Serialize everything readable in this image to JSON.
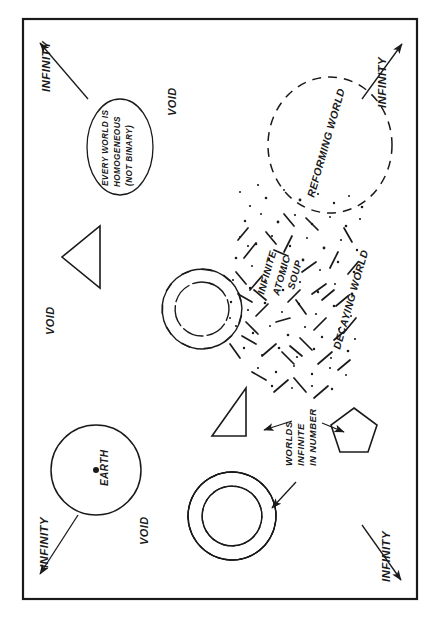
{
  "diagram": {
    "orientation": "labels rotated 90 degrees counter-clockwise",
    "background_color": "#ffffff",
    "ink_color": "#1a1a1a",
    "frame": {
      "x": 22,
      "y": 18,
      "width": 396,
      "height": 582,
      "stroke_width": 2
    }
  },
  "labels": {
    "infinity_top_left": "INFINITY",
    "infinity_top_right": "INFINITY",
    "infinity_bottom_left": "INFINITY",
    "infinity_bottom_right": "INFINITY",
    "void_upper": "VOID",
    "void_middle": "VOID",
    "void_lower": "VOID",
    "earth": "EARTH",
    "reforming_world": "REFORMING WORLD",
    "decaying_world": "DECAYING WORLD",
    "atomic_soup_line1": "INFINITE",
    "atomic_soup_line2": "ATOMIC",
    "atomic_soup_line3": "SOUP",
    "worlds_line1": "WORLDS",
    "worlds_line2": "INFINITE",
    "worlds_line3": "IN NUMBER",
    "homogeneous_line1": "EVERY WORLD IS",
    "homogeneous_line2": "HOMOGENEOUS",
    "homogeneous_line3": "(NOT BINARY)"
  },
  "shapes": {
    "ellipse_callout": {
      "cx": 120,
      "cy": 147,
      "rx": 33,
      "ry": 48
    },
    "earth_circle": {
      "cx": 96,
      "cy": 470,
      "r": 45,
      "dot_r": 3
    },
    "reforming_circle": {
      "cx": 330,
      "cy": 145,
      "rx": 62,
      "ry": 68,
      "dashed": true
    },
    "triangle_upper": {
      "points": "100,226 100,286 64,256"
    },
    "triangle_lower": {
      "points": "244,390 244,434 214,434"
    },
    "pentagon": {
      "cx": 354,
      "cy": 434,
      "r": 26
    },
    "galaxy_upper": {
      "cx": 202,
      "cy": 309,
      "arms": 11
    },
    "galaxy_lower": {
      "cx": 232,
      "cy": 516,
      "arms": 26
    }
  },
  "arrows": {
    "infinity_top_left": {
      "from": [
        86,
        96
      ],
      "to": [
        34,
        36
      ]
    },
    "infinity_top_right": {
      "from": [
        364,
        96
      ],
      "to": [
        406,
        38
      ]
    },
    "infinity_bottom_left": {
      "from": [
        76,
        518
      ],
      "to": [
        34,
        580
      ]
    },
    "infinity_bottom_right": {
      "from": [
        364,
        528
      ],
      "to": [
        406,
        584
      ]
    },
    "to_triangle": {
      "from": [
        292,
        424
      ],
      "to": [
        262,
        434
      ]
    },
    "to_pentagon": {
      "from": [
        322,
        424
      ],
      "to": [
        344,
        434
      ]
    },
    "to_galaxy": {
      "from": [
        296,
        450
      ],
      "to": [
        272,
        478
      ]
    }
  }
}
